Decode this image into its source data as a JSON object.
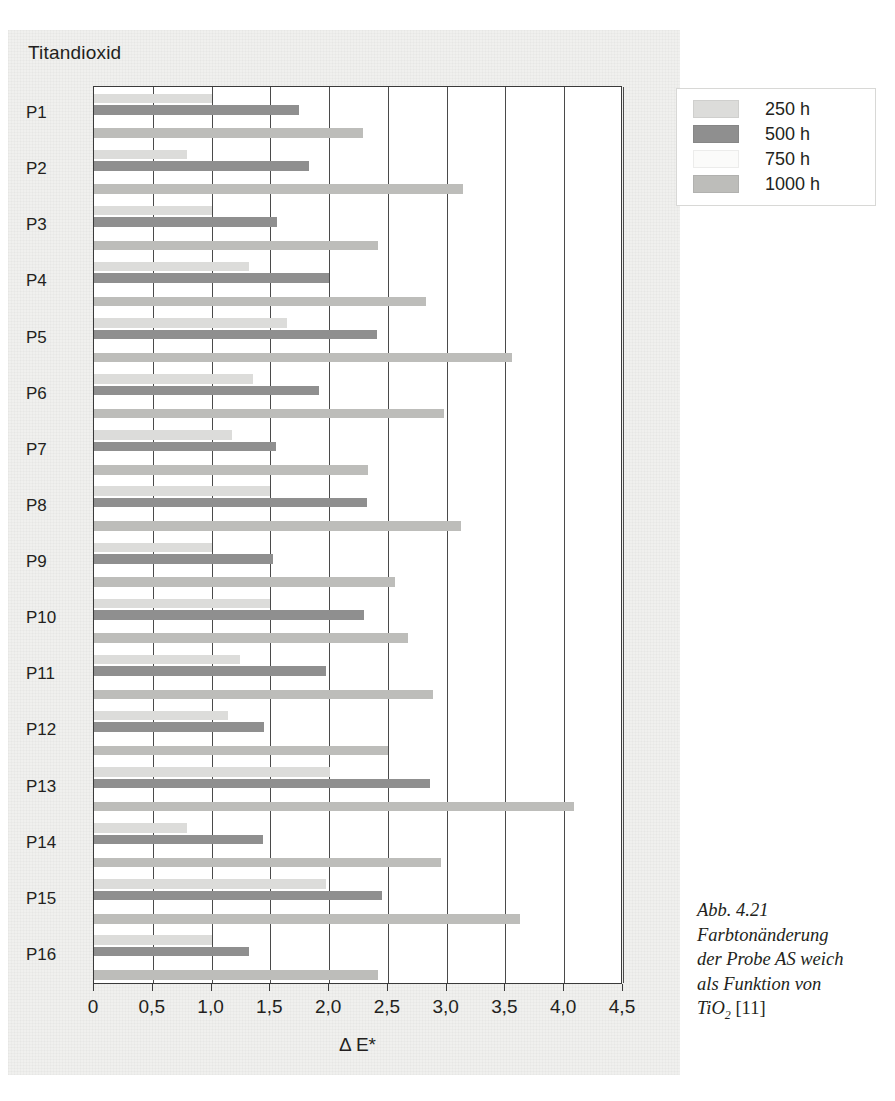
{
  "chart_title": "Titandioxid",
  "legend": {
    "position": "top-right",
    "entries": [
      {
        "label": "250 h",
        "color": "#dcdcda"
      },
      {
        "label": "500 h",
        "color": "#8f8f8f"
      },
      {
        "label": "750 h",
        "color": "#fbfbfa"
      },
      {
        "label": "1000 h",
        "color": "#bdbdba"
      }
    ]
  },
  "axis": {
    "x_title_delta": "Δ E*",
    "tick_labels": [
      "0",
      "0,5",
      "1,0",
      "1,5",
      "2,0",
      "2,5",
      "3,0",
      "3,5",
      "4,0",
      "4,5"
    ]
  },
  "caption": {
    "line1": "Abb. 4.21",
    "line2": "Farbtonänderung",
    "line3": "der Probe AS weich",
    "line4": "als Funktion von",
    "line5_prefix": "TiO",
    "line5_sub": "2",
    "line5_suffix": " [11]"
  },
  "chart_data": {
    "type": "bar",
    "orientation": "horizontal",
    "title": "Titandioxid",
    "xlabel": "Δ E*",
    "ylabel": "",
    "xlim": [
      0,
      4.5
    ],
    "xticks": [
      0,
      0.5,
      1.0,
      1.5,
      2.0,
      2.5,
      3.0,
      3.5,
      4.0,
      4.5
    ],
    "xtick_labels": [
      "0",
      "0,5",
      "1,0",
      "1,5",
      "2,0",
      "2,5",
      "3,0",
      "3,5",
      "4,0",
      "4,5"
    ],
    "grid": true,
    "legend_position": "upper right",
    "categories": [
      "P1",
      "P2",
      "P3",
      "P4",
      "P5",
      "P6",
      "P7",
      "P8",
      "P9",
      "P10",
      "P11",
      "P12",
      "P13",
      "P14",
      "P15",
      "P16"
    ],
    "series": [
      {
        "name": "250 h",
        "color": "#dcdcda",
        "values": [
          1.0,
          0.79,
          1.0,
          1.32,
          1.64,
          1.35,
          1.17,
          1.5,
          1.0,
          1.5,
          1.24,
          1.14,
          2.01,
          0.79,
          1.97,
          1.0
        ]
      },
      {
        "name": "500 h",
        "color": "#8f8f8f",
        "values": [
          1.74,
          1.83,
          1.56,
          2.0,
          2.41,
          1.91,
          1.55,
          2.32,
          1.52,
          2.3,
          1.97,
          1.45,
          2.86,
          1.44,
          2.45,
          1.32
        ]
      },
      {
        "name": "750 h",
        "color": "#fbfbfa",
        "values": [
          0.0,
          0.0,
          0.0,
          0.0,
          0.0,
          0.0,
          0.0,
          0.0,
          0.0,
          0.0,
          0.0,
          0.0,
          0.0,
          0.0,
          0.0,
          0.0
        ]
      },
      {
        "name": "1000 h",
        "color": "#bdbdba",
        "values": [
          2.29,
          3.14,
          2.42,
          2.82,
          3.56,
          2.98,
          2.33,
          3.12,
          2.56,
          2.67,
          2.88,
          2.5,
          4.08,
          2.95,
          3.62,
          2.42
        ]
      }
    ]
  }
}
